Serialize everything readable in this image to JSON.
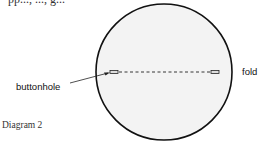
{
  "top_text": "pp..., ..., g...",
  "diagram": {
    "caption": "Diagram 2",
    "labels": {
      "buttonhole": "buttonhole",
      "fold": "fold"
    },
    "colors": {
      "circle_fill": "#f3f3f3",
      "circle_stroke": "#111111",
      "line": "#222222"
    }
  }
}
